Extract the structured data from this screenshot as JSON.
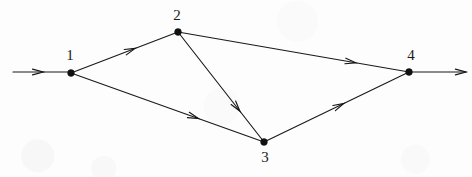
{
  "figure": {
    "background_color": "#fdfdfd",
    "ink_color": "#1a1a1a",
    "width": 472,
    "height": 177
  },
  "nodes": [
    {
      "id": "1",
      "label": "1",
      "x": 71,
      "y": 73,
      "label_x": 70,
      "label_y": 48
    },
    {
      "id": "2",
      "label": "2",
      "x": 178,
      "y": 32,
      "label_x": 177,
      "label_y": 8
    },
    {
      "id": "3",
      "label": "3",
      "x": 264,
      "y": 142,
      "label_x": 265,
      "label_y": 150
    },
    {
      "id": "4",
      "label": "4",
      "x": 409,
      "y": 72,
      "label_x": 411,
      "label_y": 48
    }
  ],
  "edges": [
    {
      "id": "e12",
      "from": "1",
      "to": "2",
      "arrow_t": 0.6
    },
    {
      "id": "e13",
      "from": "1",
      "to": "3",
      "arrow_t": 0.66
    },
    {
      "id": "e23",
      "from": "2",
      "to": "3",
      "arrow_t": 0.72
    },
    {
      "id": "e24",
      "from": "2",
      "to": "4",
      "arrow_t": 0.77
    },
    {
      "id": "e34",
      "from": "3",
      "to": "4",
      "arrow_t": 0.55
    }
  ],
  "terminals": [
    {
      "id": "source-arrow",
      "label": "source",
      "x1": 13,
      "y1": 72,
      "x2": 71,
      "y2": 72,
      "arrow_t": 0.52
    },
    {
      "id": "sink-arrow",
      "label": "sink",
      "x1": 409,
      "y1": 72,
      "x2": 466,
      "y2": 72,
      "arrow_t": 1.0
    }
  ],
  "style": {
    "node_radius": 3.4,
    "edge_stroke_width": 1.15,
    "arrow_length": 11,
    "arrow_spread_deg": 15
  }
}
